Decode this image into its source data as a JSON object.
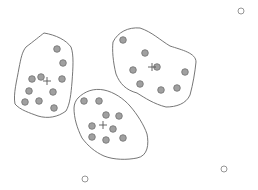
{
  "diagram": {
    "type": "clustering",
    "width": 258,
    "height": 190,
    "colors": {
      "background": "#ffffff",
      "point_fill": "#a0a0a0",
      "point_stroke": "#707070",
      "outlier_fill": "#ffffff",
      "outlier_stroke": "#8a8a8a",
      "hull_stroke": "#666666",
      "centroid_stroke": "#555555"
    },
    "clusters": [
      {
        "id": "left",
        "hull": "M26,47 C34,41 40,36 44,33 C56,35 66,40 71,47 C74,55 73,68 72,82 C71,94 70,104 66,111 C58,117 48,119 38,116 C30,113 20,110 15,104 C13,94 17,80 19,68 C21,58 22,52 26,47 Z",
        "centroid": [
          47,
          81
        ],
        "points": [
          [
            57,
            49
          ],
          [
            63,
            63
          ],
          [
            41,
            77
          ],
          [
            32,
            79
          ],
          [
            62,
            79
          ],
          [
            29,
            91
          ],
          [
            53,
            92
          ],
          [
            25,
            102
          ],
          [
            39,
            101
          ],
          [
            54,
            108
          ]
        ]
      },
      {
        "id": "right",
        "hull": "M113,42 C118,32 128,27 140,28 C152,32 160,40 170,46 C182,50 196,53 196,62 C195,72 193,84 190,95 C186,104 176,107 166,107 C154,104 145,98 137,93 C126,90 120,84 116,74 C113,62 112,50 113,42 Z",
        "centroid": [
          152,
          67
        ],
        "points": [
          [
            123,
            40
          ],
          [
            145,
            53
          ],
          [
            133,
            70
          ],
          [
            157,
            67
          ],
          [
            185,
            72
          ],
          [
            140,
            84
          ],
          [
            161,
            90
          ],
          [
            177,
            88
          ]
        ]
      },
      {
        "id": "middle",
        "hull": "M78,98 C85,91 94,88 104,90 C114,92 124,99 130,106 C137,114 144,125 147,134 C149,144 148,156 137,158 C127,160 114,160 104,156 C95,152 88,146 82,138 C77,128 74,118 74,108 C74,104 76,100 78,98 Z",
        "centroid": [
          103,
          125
        ],
        "points": [
          [
            84,
            101
          ],
          [
            99,
            101
          ],
          [
            106,
            115
          ],
          [
            119,
            116
          ],
          [
            92,
            126
          ],
          [
            113,
            129
          ],
          [
            92,
            137
          ],
          [
            106,
            140
          ],
          [
            123,
            138
          ]
        ]
      }
    ],
    "outliers": [
      [
        241,
        11
      ],
      [
        224,
        169
      ],
      [
        85,
        179
      ]
    ]
  }
}
